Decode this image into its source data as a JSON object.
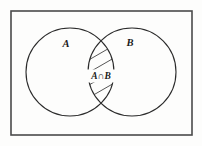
{
  "figure": {
    "background_color": "#fdfdfc",
    "stroke_color": "#2b2b2b",
    "universe": {
      "name": "universal-set-rectangle",
      "x": 11,
      "y": 11,
      "width": 181,
      "height": 124,
      "border_color": "#4a4a4a"
    },
    "sets": [
      {
        "id": "set-a",
        "label": "A",
        "label_x": 66,
        "label_y": 47,
        "cx": 70,
        "cy": 72,
        "r": 44
      },
      {
        "id": "set-b",
        "label": "B",
        "label_x": 130,
        "label_y": 46,
        "cx": 132,
        "cy": 72,
        "r": 44
      }
    ],
    "intersection": {
      "id": "intersection-region",
      "label": "A∩B",
      "label_x": 101,
      "label_y": 79,
      "fill_pattern": "diagonal-hatch",
      "hatch_count": 9,
      "hatch_angle_deg": -30
    }
  },
  "chart_data": {
    "type": "diagram",
    "diagram_type": "venn",
    "sets": [
      "A",
      "B"
    ],
    "highlighted_region": "A∩B",
    "region_labels": [
      "A",
      "B",
      "A∩B"
    ],
    "universe_shown": true,
    "shading": "diagonal hatching on A∩B only"
  }
}
